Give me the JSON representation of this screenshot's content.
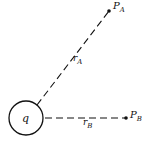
{
  "diagram": {
    "charge": {
      "label": "q",
      "cx": 26,
      "cy": 118,
      "r": 17
    },
    "points": [
      {
        "id": "A",
        "label": "P",
        "subscript": "A",
        "x": 109,
        "y": 11
      },
      {
        "id": "B",
        "label": "P",
        "subscript": "B",
        "x": 126,
        "y": 118
      }
    ],
    "distances": [
      {
        "id": "A",
        "label": "r",
        "subscript": "A"
      },
      {
        "id": "B",
        "label": "r",
        "subscript": "B"
      }
    ],
    "colors": {
      "stroke": "#111111",
      "background": "#ffffff"
    }
  }
}
